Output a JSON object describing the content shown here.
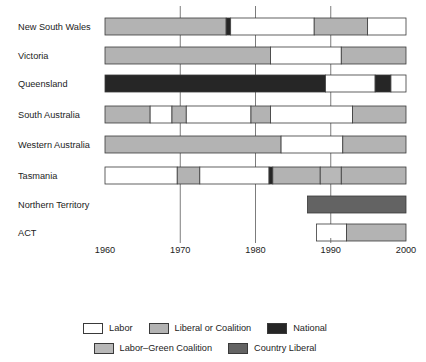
{
  "chart_data": {
    "type": "bar",
    "title": "",
    "xlabel": "",
    "ylabel": "",
    "xlim": [
      1960,
      2000
    ],
    "x_ticks": [
      1960,
      1970,
      1980,
      1990,
      2000
    ],
    "grid": true,
    "orientation": "horizontal-timeline",
    "categories": [
      "New South Wales",
      "Victoria",
      "Queensland",
      "South Australia",
      "Western Australia",
      "Tasmania",
      "Northern Territory",
      "ACT"
    ],
    "legend_position": "bottom",
    "legend": [
      {
        "label": "Labor",
        "color": "#ffffff"
      },
      {
        "label": "Liberal or Coalition",
        "color": "#b3b3b3"
      },
      {
        "label": "National",
        "color": "#262626"
      },
      {
        "label": "Labor–Green Coalition",
        "color": "#b8b8b8"
      },
      {
        "label": "Country Liberal",
        "color": "#636363"
      }
    ],
    "series": [
      {
        "name": "New South Wales",
        "segments": [
          {
            "start": 1960,
            "end": 1976.1,
            "party": "Liberal or Coalition",
            "color": "#b3b3b3"
          },
          {
            "start": 1976.1,
            "end": 1976.7,
            "party": "National",
            "color": "#262626"
          },
          {
            "start": 1976.7,
            "end": 1987.8,
            "party": "Labor",
            "color": "#ffffff"
          },
          {
            "start": 1987.8,
            "end": 1994.9,
            "party": "Liberal or Coalition",
            "color": "#b3b3b3"
          },
          {
            "start": 1994.9,
            "end": 2000,
            "party": "Labor",
            "color": "#ffffff"
          }
        ]
      },
      {
        "name": "Victoria",
        "segments": [
          {
            "start": 1960,
            "end": 1982.0,
            "party": "Liberal or Coalition",
            "color": "#b3b3b3"
          },
          {
            "start": 1982.0,
            "end": 1991.4,
            "party": "Labor",
            "color": "#ffffff"
          },
          {
            "start": 1991.4,
            "end": 2000,
            "party": "Liberal or Coalition",
            "color": "#b3b3b3"
          }
        ]
      },
      {
        "name": "Queensland",
        "segments": [
          {
            "start": 1960,
            "end": 1989.3,
            "party": "National",
            "color": "#262626"
          },
          {
            "start": 1989.3,
            "end": 1995.9,
            "party": "Labor",
            "color": "#ffffff"
          },
          {
            "start": 1995.9,
            "end": 1998.0,
            "party": "National",
            "color": "#262626"
          },
          {
            "start": 1998.0,
            "end": 2000,
            "party": "Labor",
            "color": "#ffffff"
          }
        ]
      },
      {
        "name": "South Australia",
        "segments": [
          {
            "start": 1960,
            "end": 1966.0,
            "party": "Liberal or Coalition",
            "color": "#b3b3b3"
          },
          {
            "start": 1966.0,
            "end": 1968.9,
            "party": "Labor",
            "color": "#ffffff"
          },
          {
            "start": 1968.9,
            "end": 1970.8,
            "party": "Liberal or Coalition",
            "color": "#b3b3b3"
          },
          {
            "start": 1970.8,
            "end": 1979.4,
            "party": "Labor",
            "color": "#ffffff"
          },
          {
            "start": 1979.4,
            "end": 1982.0,
            "party": "Liberal or Coalition",
            "color": "#b3b3b3"
          },
          {
            "start": 1982.0,
            "end": 1992.9,
            "party": "Labor",
            "color": "#ffffff"
          },
          {
            "start": 1992.9,
            "end": 2000,
            "party": "Liberal or Coalition",
            "color": "#b3b3b3"
          }
        ]
      },
      {
        "name": "Western Australia",
        "segments": [
          {
            "start": 1960,
            "end": 1983.4,
            "party": "Liberal or Coalition",
            "color": "#b3b3b3"
          },
          {
            "start": 1983.4,
            "end": 1991.6,
            "party": "Labor",
            "color": "#ffffff"
          },
          {
            "start": 1991.6,
            "end": 2000,
            "party": "Liberal or Coalition",
            "color": "#b3b3b3"
          }
        ]
      },
      {
        "name": "Tasmania",
        "segments": [
          {
            "start": 1960,
            "end": 1969.6,
            "party": "Labor",
            "color": "#ffffff"
          },
          {
            "start": 1969.6,
            "end": 1972.6,
            "party": "Liberal or Coalition",
            "color": "#b3b3b3"
          },
          {
            "start": 1972.6,
            "end": 1981.8,
            "party": "Labor",
            "color": "#ffffff"
          },
          {
            "start": 1981.8,
            "end": 1982.3,
            "party": "National",
            "color": "#262626"
          },
          {
            "start": 1982.3,
            "end": 1988.6,
            "party": "Liberal or Coalition",
            "color": "#b3b3b3"
          },
          {
            "start": 1988.6,
            "end": 1991.4,
            "party": "Labor–Green Coalition",
            "color": "#b8b8b8"
          },
          {
            "start": 1991.4,
            "end": 2000,
            "party": "Liberal or Coalition",
            "color": "#b3b3b3"
          }
        ]
      },
      {
        "name": "Northern Territory",
        "segments": [
          {
            "start": 1986.9,
            "end": 2000,
            "party": "Country Liberal",
            "color": "#636363"
          }
        ]
      },
      {
        "name": "ACT",
        "segments": [
          {
            "start": 1988.1,
            "end": 1992.1,
            "party": "Labor",
            "color": "#ffffff"
          },
          {
            "start": 1992.1,
            "end": 2000,
            "party": "Liberal or Coalition",
            "color": "#b3b3b3"
          }
        ]
      }
    ]
  },
  "governance": {
    "title": "Dominant types of urban governance",
    "phases": [
      {
        "label": "Colonial bureaucracy"
      },
      {
        "label": "SDM"
      },
      {
        "label": "Corporate liberalism"
      }
    ]
  }
}
